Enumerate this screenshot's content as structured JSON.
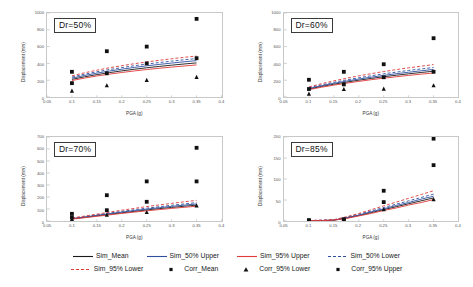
{
  "figure": {
    "axis_labels": {
      "x": "PGA (g)",
      "y": "Displacement (mm)"
    }
  },
  "legend": {
    "rows": [
      [
        {
          "label": "Sim_Mean",
          "key": "line-solid-black",
          "color": "#1a1a1a"
        },
        {
          "label": "Sim_50% Upper",
          "key": "line-solid-blue",
          "color": "#2f4f9e"
        },
        {
          "label": "Sim_95% Upper",
          "key": "line-solid-red",
          "color": "#e03a3a"
        },
        {
          "label": "Sim_50% Lower",
          "key": "line-dashed-blue",
          "color": "#2f4f9e"
        }
      ],
      [
        {
          "label": "Sim_95% Lower",
          "key": "line-dashed-red",
          "color": "#e03a3a"
        },
        {
          "label": "Corr_Mean",
          "key": "marker-square",
          "color": "#111111"
        },
        {
          "label": "Corr_95% Lower",
          "key": "marker-triangle",
          "color": "#111111"
        },
        {
          "label": "Corr_95% Upper",
          "key": "marker-square",
          "color": "#111111"
        }
      ]
    ]
  },
  "chart_data": [
    {
      "type": "line",
      "panel_label": "Dr=50%",
      "title": "Dr=50%",
      "xlabel": "PGA (g)",
      "ylabel": "Displacement (mm)",
      "xlim": [
        0.05,
        0.4
      ],
      "ylim": [
        0,
        1000
      ],
      "xticks": [
        0.05,
        0.1,
        0.15,
        0.2,
        0.25,
        0.3,
        0.35,
        0.4
      ],
      "xticklabels": [
        "0.05",
        "0.1",
        "0.15",
        "0.2",
        "0.25",
        "0.3",
        "0.35",
        "0.4"
      ],
      "yticks": [
        0,
        200,
        400,
        600,
        800,
        1000
      ],
      "yticklabels": [
        "0",
        "200",
        "400",
        "600",
        "800",
        "1000"
      ],
      "grid": false,
      "x": [
        0.1,
        0.125,
        0.15,
        0.175,
        0.2,
        0.225,
        0.25,
        0.275,
        0.3,
        0.325,
        0.35
      ],
      "series": [
        {
          "name": "Sim_Mean",
          "style": "solid",
          "color": "#1a1a1a",
          "values": [
            210,
            240,
            266,
            290,
            311,
            330,
            348,
            364,
            379,
            393,
            406
          ]
        },
        {
          "name": "Sim_50% Upper",
          "style": "solid",
          "color": "#2f4f9e",
          "values": [
            224,
            256,
            284,
            309,
            331,
            352,
            371,
            388,
            404,
            419,
            433
          ]
        },
        {
          "name": "Sim_50% Lower",
          "style": "dashed",
          "color": "#2f4f9e",
          "values": [
            237,
            271,
            300,
            327,
            350,
            372,
            392,
            410,
            427,
            443,
            458
          ]
        },
        {
          "name": "Sim_95% Upper",
          "style": "solid",
          "color": "#e03a3a",
          "values": [
            196,
            225,
            250,
            272,
            292,
            310,
            327,
            342,
            356,
            369,
            382
          ]
        },
        {
          "name": "Sim_95% Lower",
          "style": "dashed",
          "color": "#e03a3a",
          "values": [
            252,
            288,
            319,
            348,
            373,
            396,
            417,
            437,
            455,
            472,
            488
          ]
        }
      ],
      "scatter": [
        {
          "name": "Corr_Mean",
          "marker": "square",
          "color": "#111111",
          "points": [
            [
              0.1,
              300
            ],
            [
              0.17,
              545
            ],
            [
              0.25,
              600
            ],
            [
              0.35,
              930
            ]
          ]
        },
        {
          "name": "Corr_95% Lower",
          "marker": "triangle",
          "color": "#111111",
          "points": [
            [
              0.1,
              75
            ],
            [
              0.17,
              140
            ],
            [
              0.25,
              205
            ],
            [
              0.35,
              240
            ]
          ]
        },
        {
          "name": "Corr_95% Upper",
          "marker": "square",
          "color": "#111111",
          "points": [
            [
              0.1,
              165
            ],
            [
              0.17,
              282
            ],
            [
              0.25,
              400
            ],
            [
              0.35,
              462
            ]
          ]
        }
      ]
    },
    {
      "type": "line",
      "panel_label": "Dr=60%",
      "title": "Dr=60%",
      "xlabel": "PGA (g)",
      "ylabel": "Displacement (mm)",
      "xlim": [
        0.05,
        0.4
      ],
      "ylim": [
        0,
        1000
      ],
      "xticks": [
        0.05,
        0.1,
        0.15,
        0.2,
        0.25,
        0.3,
        0.35,
        0.4
      ],
      "xticklabels": [
        "0.05",
        "0.1",
        "0.15",
        "0.2",
        "0.25",
        "0.3",
        "0.35",
        "0.4"
      ],
      "yticks": [
        0,
        200,
        400,
        600,
        800,
        1000
      ],
      "yticklabels": [
        "0",
        "200",
        "400",
        "600",
        "800",
        "1000"
      ],
      "grid": false,
      "x": [
        0.1,
        0.125,
        0.15,
        0.175,
        0.2,
        0.225,
        0.25,
        0.275,
        0.3,
        0.325,
        0.35
      ],
      "series": [
        {
          "name": "Sim_Mean",
          "style": "solid",
          "color": "#1a1a1a",
          "values": [
            95,
            125,
            152,
            177,
            200,
            221,
            241,
            259,
            276,
            292,
            307
          ]
        },
        {
          "name": "Sim_50% Upper",
          "style": "solid",
          "color": "#2f4f9e",
          "values": [
            102,
            134,
            163,
            189,
            214,
            236,
            257,
            277,
            295,
            312,
            328
          ]
        },
        {
          "name": "Sim_50% Lower",
          "style": "dashed",
          "color": "#2f4f9e",
          "values": [
            110,
            144,
            175,
            203,
            229,
            253,
            276,
            296,
            316,
            334,
            351
          ]
        },
        {
          "name": "Sim_95% Upper",
          "style": "solid",
          "color": "#e03a3a",
          "values": [
            88,
            116,
            141,
            164,
            186,
            206,
            224,
            241,
            257,
            272,
            286
          ]
        },
        {
          "name": "Sim_95% Lower",
          "style": "dashed",
          "color": "#e03a3a",
          "values": [
            120,
            158,
            192,
            223,
            252,
            278,
            303,
            326,
            347,
            367,
            386
          ]
        }
      ],
      "scatter": [
        {
          "name": "Corr_Mean",
          "marker": "square",
          "color": "#111111",
          "points": [
            [
              0.1,
              205
            ],
            [
              0.17,
              300
            ],
            [
              0.25,
              390
            ],
            [
              0.35,
              700
            ]
          ]
        },
        {
          "name": "Corr_95% Lower",
          "marker": "triangle",
          "color": "#111111",
          "points": [
            [
              0.1,
              40
            ],
            [
              0.17,
              95
            ],
            [
              0.25,
              100
            ],
            [
              0.35,
              140
            ]
          ]
        },
        {
          "name": "Corr_95% Upper",
          "marker": "square",
          "color": "#111111",
          "points": [
            [
              0.1,
              95
            ],
            [
              0.17,
              150
            ],
            [
              0.25,
              235
            ],
            [
              0.35,
              300
            ]
          ]
        }
      ]
    },
    {
      "type": "line",
      "panel_label": "Dr=70%",
      "title": "Dr=70%",
      "xlabel": "PGA (g)",
      "ylabel": "Displacement (mm)",
      "xlim": [
        0.05,
        0.4
      ],
      "ylim": [
        0,
        700
      ],
      "xticks": [
        0.05,
        0.1,
        0.15,
        0.2,
        0.25,
        0.3,
        0.35,
        0.4
      ],
      "xticklabels": [
        "0.05",
        "0.1",
        "0.15",
        "0.2",
        "0.25",
        "0.3",
        "0.35",
        "0.4"
      ],
      "yticks": [
        0,
        100,
        200,
        300,
        400,
        500,
        600,
        700
      ],
      "yticklabels": [
        "0",
        "100",
        "200",
        "300",
        "400",
        "500",
        "600",
        "700"
      ],
      "grid": false,
      "x": [
        0.1,
        0.125,
        0.15,
        0.175,
        0.2,
        0.225,
        0.25,
        0.275,
        0.3,
        0.325,
        0.35
      ],
      "series": [
        {
          "name": "Sim_Mean",
          "style": "solid",
          "color": "#1a1a1a",
          "values": [
            18,
            30,
            43,
            56,
            68,
            80,
            92,
            103,
            113,
            123,
            132
          ]
        },
        {
          "name": "Sim_50% Upper",
          "style": "solid",
          "color": "#2f4f9e",
          "values": [
            20,
            33,
            47,
            61,
            74,
            87,
            99,
            111,
            122,
            132,
            142
          ]
        },
        {
          "name": "Sim_50% Lower",
          "style": "dashed",
          "color": "#2f4f9e",
          "values": [
            22,
            36,
            51,
            66,
            80,
            94,
            107,
            119,
            131,
            142,
            153
          ]
        },
        {
          "name": "Sim_95% Upper",
          "style": "solid",
          "color": "#e03a3a",
          "values": [
            16,
            27,
            39,
            51,
            63,
            74,
            85,
            95,
            105,
            114,
            123
          ]
        },
        {
          "name": "Sim_95% Lower",
          "style": "dashed",
          "color": "#e03a3a",
          "values": [
            25,
            41,
            57,
            74,
            90,
            105,
            120,
            134,
            147,
            160,
            172
          ]
        }
      ],
      "scatter": [
        {
          "name": "Corr_Mean",
          "marker": "square",
          "color": "#111111",
          "points": [
            [
              0.1,
              60
            ],
            [
              0.17,
              215
            ],
            [
              0.25,
              330
            ],
            [
              0.35,
              610
            ]
          ]
        },
        {
          "name": "Corr_95% Lower",
          "marker": "triangle",
          "color": "#111111",
          "points": [
            [
              0.1,
              18
            ],
            [
              0.17,
              52
            ],
            [
              0.25,
              75
            ],
            [
              0.35,
              130
            ]
          ]
        },
        {
          "name": "Corr_95% Upper",
          "marker": "square",
          "color": "#111111",
          "points": [
            [
              0.1,
              30
            ],
            [
              0.17,
              90
            ],
            [
              0.25,
              160
            ],
            [
              0.35,
              330
            ]
          ]
        }
      ]
    },
    {
      "type": "line",
      "panel_label": "Dr=85%",
      "title": "Dr=85%",
      "xlabel": "PGA (g)",
      "ylabel": "Displacement (mm)",
      "xlim": [
        0.05,
        0.4
      ],
      "ylim": [
        0,
        200
      ],
      "xticks": [
        0.05,
        0.1,
        0.15,
        0.2,
        0.25,
        0.3,
        0.35,
        0.4
      ],
      "xticklabels": [
        "0.05",
        "0.1",
        "0.15",
        "0.2",
        "0.25",
        "0.3",
        "0.35",
        "0.4"
      ],
      "yticks": [
        0,
        50,
        100,
        150,
        200
      ],
      "yticklabels": [
        "0",
        "50",
        "100",
        "150",
        "200"
      ],
      "grid": false,
      "x": [
        0.1,
        0.125,
        0.15,
        0.175,
        0.2,
        0.225,
        0.25,
        0.275,
        0.3,
        0.325,
        0.35
      ],
      "series": [
        {
          "name": "Sim_Mean",
          "style": "solid",
          "color": "#1a1a1a",
          "values": [
            1,
            1,
            2,
            7,
            13,
            20,
            27,
            34,
            41,
            48,
            55
          ]
        },
        {
          "name": "Sim_50% Upper",
          "style": "solid",
          "color": "#2f4f9e",
          "values": [
            1,
            1,
            2,
            8,
            14,
            22,
            29,
            37,
            44,
            52,
            59
          ]
        },
        {
          "name": "Sim_50% Lower",
          "style": "dashed",
          "color": "#2f4f9e",
          "values": [
            1,
            2,
            3,
            9,
            16,
            24,
            32,
            40,
            48,
            56,
            64
          ]
        },
        {
          "name": "Sim_95% Upper",
          "style": "solid",
          "color": "#e03a3a",
          "values": [
            1,
            1,
            2,
            6,
            12,
            18,
            25,
            31,
            38,
            44,
            51
          ]
        },
        {
          "name": "Sim_95% Lower",
          "style": "dashed",
          "color": "#e03a3a",
          "values": [
            1,
            2,
            3,
            10,
            18,
            27,
            36,
            45,
            54,
            63,
            72
          ]
        }
      ],
      "scatter": [
        {
          "name": "Corr_Mean",
          "marker": "square",
          "color": "#111111",
          "points": [
            [
              0.1,
              2
            ],
            [
              0.17,
              4
            ],
            [
              0.25,
              72
            ],
            [
              0.35,
              196
            ]
          ]
        },
        {
          "name": "Corr_95% Lower",
          "marker": "triangle",
          "color": "#111111",
          "points": [
            [
              0.1,
              1
            ],
            [
              0.17,
              2
            ],
            [
              0.25,
              28
            ],
            [
              0.35,
              52
            ]
          ]
        },
        {
          "name": "Corr_95% Upper",
          "marker": "square",
          "color": "#111111",
          "points": [
            [
              0.1,
              1
            ],
            [
              0.17,
              3
            ],
            [
              0.25,
              45
            ],
            [
              0.35,
              133
            ]
          ]
        }
      ]
    }
  ]
}
